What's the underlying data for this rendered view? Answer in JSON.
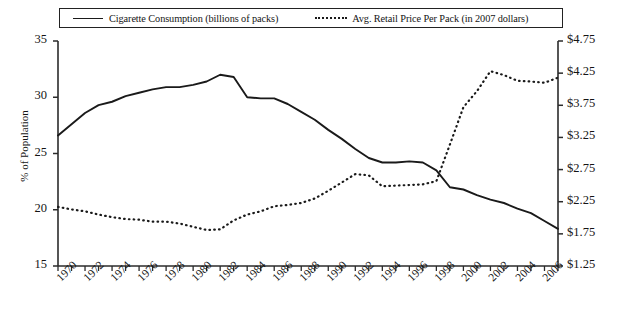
{
  "chart_data": {
    "type": "line",
    "title": "",
    "subtitle": "",
    "xlabel": "",
    "ylabel": "% of Population",
    "y2label": "",
    "grid": false,
    "legend_position": "top",
    "xlim": [
      1970,
      2007
    ],
    "ylim": [
      15,
      35
    ],
    "y2lim": [
      1.25,
      4.75
    ],
    "yticks": [
      "15",
      "20",
      "25",
      "30",
      "35"
    ],
    "ytick_values": [
      15,
      20,
      25,
      30,
      35
    ],
    "y2ticks": [
      "$1.25",
      "$1.75",
      "$2.25",
      "$2.75",
      "$3.25",
      "$3.75",
      "$4.25",
      "$4.75"
    ],
    "y2tick_values": [
      1.25,
      1.75,
      2.25,
      2.75,
      3.25,
      3.75,
      4.25,
      4.75
    ],
    "xticks": [
      "1970",
      "1972",
      "1974",
      "1976",
      "1978",
      "1980",
      "1982",
      "1984",
      "1986",
      "1988",
      "1990",
      "1992",
      "1994",
      "1996",
      "1998",
      "2000",
      "2002",
      "2004",
      "2006"
    ],
    "xtick_values": [
      1970,
      1972,
      1974,
      1976,
      1978,
      1980,
      1982,
      1984,
      1986,
      1988,
      1990,
      1992,
      1994,
      1996,
      1998,
      2000,
      2002,
      2004,
      2006
    ],
    "x": [
      1970,
      1971,
      1972,
      1973,
      1974,
      1975,
      1976,
      1977,
      1978,
      1979,
      1980,
      1981,
      1982,
      1983,
      1984,
      1985,
      1986,
      1987,
      1988,
      1989,
      1990,
      1991,
      1992,
      1993,
      1994,
      1995,
      1996,
      1997,
      1998,
      1999,
      2000,
      2001,
      2002,
      2003,
      2004,
      2005,
      2006,
      2007
    ],
    "series": [
      {
        "name": "Cigarette Consumption (billions of packs)",
        "axis": "left",
        "style": "solid",
        "color": "#1a1a1a",
        "values": [
          26.6,
          27.6,
          28.6,
          29.3,
          29.6,
          30.1,
          30.4,
          30.7,
          30.9,
          30.9,
          31.1,
          31.4,
          32.0,
          31.8,
          30.0,
          29.9,
          29.9,
          29.4,
          28.7,
          28.0,
          27.1,
          26.3,
          25.4,
          24.6,
          24.2,
          24.2,
          24.3,
          24.2,
          23.5,
          22.0,
          21.8,
          21.3,
          20.9,
          20.6,
          20.1,
          19.7,
          19.0,
          18.3
        ]
      },
      {
        "name": "Avg. Retail Price Per Pack (in 2007 dollars)",
        "axis": "right",
        "style": "dotted",
        "color": "#1a1a1a",
        "values": [
          2.17,
          2.13,
          2.1,
          2.05,
          2.01,
          1.98,
          1.97,
          1.94,
          1.94,
          1.91,
          1.86,
          1.81,
          1.82,
          1.96,
          2.05,
          2.1,
          2.18,
          2.2,
          2.23,
          2.3,
          2.42,
          2.55,
          2.68,
          2.66,
          2.49,
          2.5,
          2.51,
          2.52,
          2.57,
          3.14,
          3.72,
          3.97,
          4.28,
          4.22,
          4.13,
          4.12,
          4.1,
          4.18
        ]
      }
    ]
  },
  "legend": {
    "entries": [
      {
        "label": "Cigarette Consumption (billions of packs)",
        "style": "solid"
      },
      {
        "label": "Avg. Retail Price Per Pack (in 2007 dollars)",
        "style": "dotted"
      }
    ]
  }
}
